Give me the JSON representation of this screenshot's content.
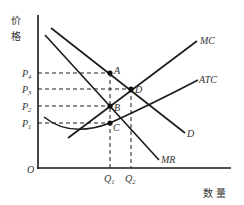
{
  "diagram": {
    "y_axis_label": [
      "价",
      "格"
    ],
    "x_axis_label": "数 量",
    "origin_label": "O",
    "price_levels": [
      {
        "base": "P",
        "sub": "4"
      },
      {
        "base": "P",
        "sub": "3"
      },
      {
        "base": "P",
        "sub": "2"
      },
      {
        "base": "P",
        "sub": "1"
      }
    ],
    "quantity_levels": [
      {
        "base": "Q",
        "sub": "1"
      },
      {
        "base": "Q",
        "sub": "2"
      }
    ],
    "curves": {
      "mc": "MC",
      "atc": "ATC",
      "d": "D",
      "mr": "MR"
    },
    "points": {
      "a": "A",
      "b": "B",
      "c": "C",
      "d": "D"
    }
  }
}
